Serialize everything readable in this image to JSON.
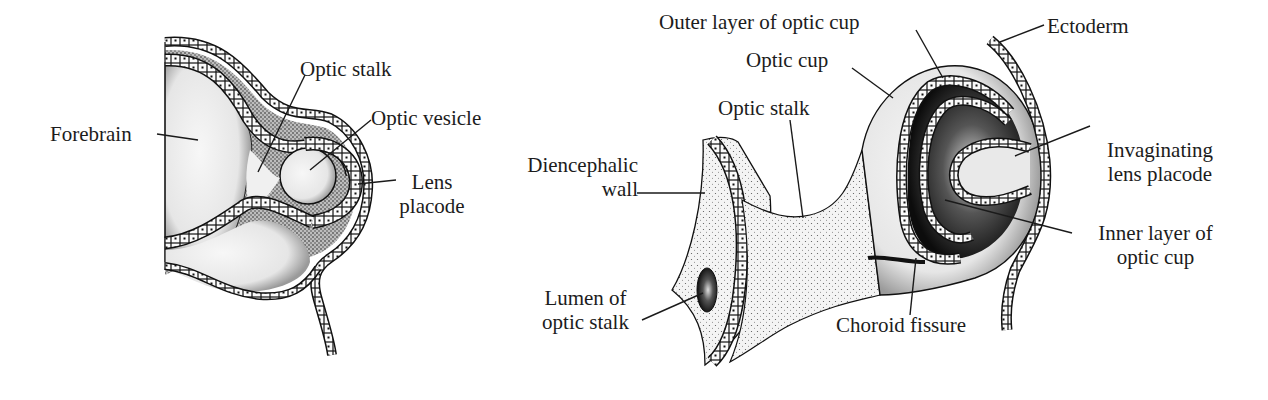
{
  "figure": {
    "panels": [
      {
        "id": "left",
        "description": "Optic vesicle stage",
        "labels": {
          "forebrain": "Forebrain",
          "optic_stalk": "Optic stalk",
          "optic_vesicle": "Optic vesicle",
          "lens_placode_line1": "Lens",
          "lens_placode_line2": "placode"
        }
      },
      {
        "id": "right",
        "description": "Optic cup stage",
        "labels": {
          "outer_layer": "Outer layer of optic cup",
          "ectoderm": "Ectoderm",
          "optic_cup": "Optic cup",
          "optic_stalk": "Optic stalk",
          "diencephalic_line1": "Diencephalic",
          "diencephalic_line2": "wall",
          "invaginating_line1": "Invaginating",
          "invaginating_line2": "lens placode",
          "inner_layer_line1": "Inner layer of",
          "inner_layer_line2": "optic cup",
          "lumen_line1": "Lumen of",
          "lumen_line2": "optic stalk",
          "choroid_fissure": "Choroid fissure"
        }
      }
    ],
    "colors": {
      "ink": "#1a1a1a",
      "background": "#ffffff",
      "fill_light": "#f2f2f2",
      "fill_dark": "#111111"
    }
  }
}
